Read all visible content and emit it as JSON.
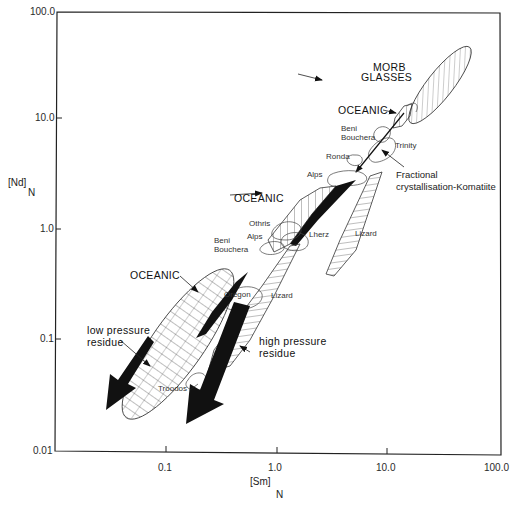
{
  "figure": {
    "x_axis": {
      "label": "[Sm]",
      "subscript": "N",
      "scale": "log",
      "range": [
        0.01,
        100.0
      ],
      "ticks": [
        "0.1",
        "1.0",
        "10.0",
        "100.0"
      ]
    },
    "y_axis": {
      "label": "[Nd]",
      "subscript": "N",
      "scale": "log",
      "range": [
        0.01,
        100.0
      ],
      "ticks": [
        "100.0",
        "10.0",
        "1.0",
        "0.1",
        "0.01"
      ]
    },
    "labels": {
      "morb_glasses_1": "MORB",
      "morb_glasses_2": "GLASSES",
      "oceanic_top": "OCEANIC",
      "beni_bouchera_top_1": "Beni",
      "beni_bouchera_top_2": "Bouchera",
      "trinity": "Trinity",
      "ronda": "Ronda",
      "fractional_1": "Fractional",
      "fractional_2": "crystallisation-Komatiite",
      "alps_top": "Alps",
      "oceanic_mid": "OCEANIC",
      "othris": "Othris",
      "alps_mid": "Alps",
      "beni_bouchera_mid_1": "Beni",
      "beni_bouchera_mid_2": "Bouchera",
      "lherz": "Lherz",
      "lizard_right": "Lizard",
      "oceanic_low": "OCEANIC",
      "oregon": "Oregon",
      "lizard_low": "Lizard",
      "low_pressure_1": "low pressure",
      "low_pressure_2": "residue",
      "high_pressure_1": "high pressure",
      "high_pressure_2": "residue",
      "troodos": "Troodos"
    },
    "fields": [
      {
        "name": "MORB GLASSES",
        "pattern": "diagonal-hatch"
      },
      {
        "name": "OCEANIC (upper)",
        "pattern": "vertical-hatch"
      },
      {
        "name": "OCEANIC (middle)",
        "pattern": "vertical-hatch"
      },
      {
        "name": "OCEANIC (lower)",
        "pattern": "grid-hatch"
      },
      {
        "name": "Lizard",
        "pattern": "horizontal-hatch"
      },
      {
        "name": "Beni Bouchera",
        "pattern": "outline"
      },
      {
        "name": "Trinity",
        "pattern": "outline"
      },
      {
        "name": "Ronda",
        "pattern": "outline"
      },
      {
        "name": "Alps",
        "pattern": "outline"
      },
      {
        "name": "Othris",
        "pattern": "outline"
      },
      {
        "name": "Lherz",
        "pattern": "outline"
      },
      {
        "name": "Oregon",
        "pattern": "outline"
      },
      {
        "name": "Troodos",
        "pattern": "outline"
      }
    ],
    "trends": [
      {
        "name": "Fractional crystallisation-Komatiite",
        "style": "thin-arrow"
      },
      {
        "name": "low pressure residue",
        "style": "solid-arrow"
      },
      {
        "name": "high pressure residue",
        "style": "solid-arrow"
      }
    ]
  }
}
